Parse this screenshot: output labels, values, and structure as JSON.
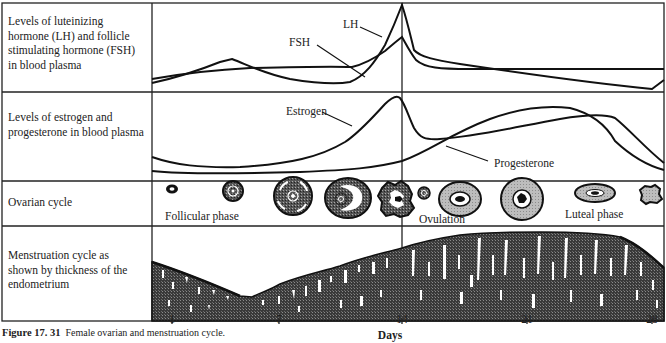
{
  "rows": [
    {
      "id": "hormones",
      "label_lines": "Levels of luteinizing hormone (LH) and follicle stimulating hormone (FSH) in blood plasma"
    },
    {
      "id": "steroids",
      "label_lines": "Levels of estrogen and progesterone in blood plasma"
    },
    {
      "id": "ovarian",
      "label_lines": "Ovarian cycle"
    },
    {
      "id": "endometrium",
      "label_lines": "Menstruation cycle as shown by thickness of the endometrium"
    }
  ],
  "curve_labels": {
    "lh": "LH",
    "fsh": "FSH",
    "estrogen": "Estrogen",
    "progesterone": "Progesterone"
  },
  "phase_labels": {
    "follicular": "Follicular phase",
    "ovulation": "Ovulation",
    "luteal": "Luteal phase"
  },
  "x_axis": {
    "title": "Days",
    "ticks": [
      "1",
      "7",
      "14",
      "21",
      "28"
    ]
  },
  "caption": {
    "number": "Figure 17. 31",
    "text": "Female ovarian and menstruation cycle."
  },
  "colors": {
    "line": "#111111",
    "follicle_dark": "#2b2b2b",
    "follicle_light": "#b5b5b5",
    "endometrium": "#3a3a3a"
  }
}
